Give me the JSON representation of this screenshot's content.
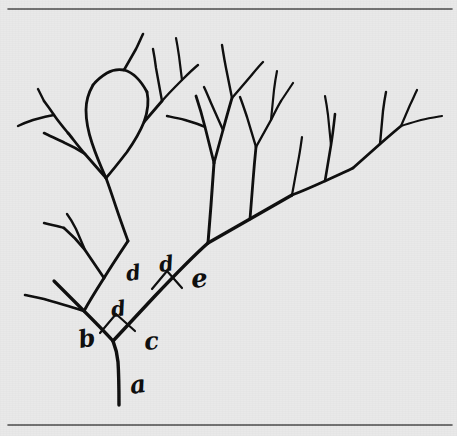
{
  "figure": {
    "background_color": "#e9e9e9",
    "ink_color": "#0d0d0d",
    "rule_color": "#4a4a4a",
    "width": 457,
    "height": 436
  },
  "rules": [
    {
      "name": "top-rule",
      "y": 9,
      "x1": 8,
      "x2": 452
    },
    {
      "name": "bottom-rule",
      "y": 425,
      "x1": 8,
      "x2": 452
    }
  ],
  "labels": [
    {
      "id": "a",
      "text": "a",
      "x": 131,
      "y": 394,
      "size": 25,
      "rotate": -8,
      "meaning": "trunk-segment"
    },
    {
      "id": "b",
      "text": "b",
      "x": 80,
      "y": 348,
      "size": 24,
      "rotate": -10,
      "meaning": "left-branch-segment"
    },
    {
      "id": "c",
      "text": "c",
      "x": 145,
      "y": 350,
      "size": 24,
      "rotate": -6,
      "meaning": "right-branch-segment"
    },
    {
      "id": "d1",
      "text": "d",
      "x": 112,
      "y": 317,
      "size": 21,
      "rotate": -8,
      "meaning": "lower-fork-angle"
    },
    {
      "id": "d2",
      "text": "d",
      "x": 127,
      "y": 281,
      "size": 21,
      "rotate": -8,
      "meaning": "upper-left-angle"
    },
    {
      "id": "d3",
      "text": "d",
      "x": 160,
      "y": 272,
      "size": 21,
      "rotate": -8,
      "meaning": "upper-fork-angle"
    },
    {
      "id": "e",
      "text": "e",
      "x": 192,
      "y": 288,
      "size": 26,
      "rotate": -6,
      "meaning": "upper-right-branch-segment"
    }
  ],
  "angle_arcs": [
    {
      "name": "lower-fork-arc",
      "d": "M 100 333 L 116 314 L 135 331"
    },
    {
      "name": "upper-fork-arc",
      "d": "M 152 289 L 167 271 L 182 288"
    }
  ],
  "branches": [
    {
      "name": "trunk",
      "w": 3.4,
      "d": "M 119 405 C 119 392, 119 377, 118 362 C 117 352, 115 346, 113 341"
    },
    {
      "name": "left-main",
      "w": 3.2,
      "d": "M 113 341 C 104 331, 94 321, 84 311 C 72 299, 63 290, 54 281"
    },
    {
      "name": "right-main",
      "w": 3.4,
      "d": "M 113 341 C 126 327, 140 312, 154 297 C 172 278, 190 259, 208 243"
    },
    {
      "name": "left-main-upper",
      "w": 3.0,
      "d": "M 84 311 C 90 300, 97 289, 104 278 C 112 265, 120 253, 128 241"
    },
    {
      "name": "left-lower-twig",
      "w": 2.6,
      "d": "M 84 311 C 72 307, 58 303, 44 299 C 36 297, 30 296, 25 295"
    },
    {
      "name": "left-fork-node",
      "w": 2.8,
      "d": "M 104 278 C 98 269, 91 259, 85 250 C 78 241, 71 234, 64 228"
    },
    {
      "name": "left-fork-b1",
      "w": 2.4,
      "d": "M 85 250 C 82 243, 79 236, 76 229 C 73 223, 70 218, 67 214"
    },
    {
      "name": "left-fork-b2",
      "w": 2.4,
      "d": "M 64 228 C 58 226, 51 225, 44 223"
    },
    {
      "name": "left-top-stem",
      "w": 2.8,
      "d": "M 128 241 C 124 230, 120 219, 116 207 C 112 195, 109 186, 106 178"
    },
    {
      "name": "left-canopy-node",
      "w": 2.8,
      "d": "M 106 178 C 99 170, 92 162, 85 154 C 78 146, 73 139, 68 133"
    },
    {
      "name": "left-canopy-left",
      "w": 2.6,
      "d": "M 85 154 C 79 150, 72 146, 65 143 C 57 139, 50 136, 44 133"
    },
    {
      "name": "left-canopy-up",
      "w": 2.6,
      "d": "M 68 133 C 63 127, 58 121, 54 115 C 50 109, 47 105, 44 101"
    },
    {
      "name": "left-canopy-tip1",
      "w": 2.4,
      "d": "M 54 115 C 47 116, 40 118, 33 120 C 27 122, 22 124, 18 126"
    },
    {
      "name": "left-canopy-tip2",
      "w": 2.4,
      "d": "M 44 101 C 42 97, 40 93, 38 89"
    },
    {
      "name": "leaf-left-arc",
      "w": 2.8,
      "d": "M 106 178 C 101 167, 96 155, 92 143 C 88 131, 86 120, 86 110 C 86 100, 89 92, 93 85"
    },
    {
      "name": "leaf-right-arc",
      "w": 2.8,
      "d": "M 106 178 C 113 170, 120 161, 127 152 C 134 142, 140 132, 144 122 C 148 111, 149 101, 147 92"
    },
    {
      "name": "leaf-apex",
      "w": 2.8,
      "d": "M 93 85 C 97 80, 102 76, 107 73 C 112 70, 118 69, 124 70 C 132 72, 140 79, 147 92"
    },
    {
      "name": "leaf-stem-up",
      "w": 2.6,
      "d": "M 124 70 C 128 63, 132 56, 136 49 C 139 43, 141 38, 143 34"
    },
    {
      "name": "mid-left-branch",
      "w": 2.8,
      "d": "M 144 122 C 150 115, 156 108, 162 101"
    },
    {
      "name": "mid-left-tip",
      "w": 2.4,
      "d": "M 162 101 C 160 90, 158 79, 156 68 C 155 60, 154 54, 153 49"
    },
    {
      "name": "mid-left-tip2",
      "w": 2.4,
      "d": "M 162 101 C 168 94, 175 87, 182 80 C 188 74, 193 69, 198 65"
    },
    {
      "name": "mid-tip-end",
      "w": 2.2,
      "d": "M 182 80 C 181 72, 180 64, 179 56 C 178 49, 177 43, 176 38"
    },
    {
      "name": "center-stem",
      "w": 3.0,
      "d": "M 208 243 C 209 231, 210 218, 211 205 C 212 190, 213 176, 214 163"
    },
    {
      "name": "center-node-left",
      "w": 2.8,
      "d": "M 214 163 C 211 151, 208 139, 205 127 C 202 115, 199 105, 196 96"
    },
    {
      "name": "center-left-tip",
      "w": 2.4,
      "d": "M 205 127 C 199 124, 192 122, 185 120 C 178 118, 172 117, 167 116"
    },
    {
      "name": "center-up-stem",
      "w": 2.8,
      "d": "M 214 163 C 217 152, 220 141, 223 130 C 226 119, 229 108, 232 98"
    },
    {
      "name": "center-up-fork-l",
      "w": 2.4,
      "d": "M 223 130 C 219 121, 215 112, 211 103 C 208 96, 206 91, 204 87"
    },
    {
      "name": "center-up-fork-r",
      "w": 2.4,
      "d": "M 232 98 C 230 88, 228 78, 226 68 C 224 58, 223 51, 222 45"
    },
    {
      "name": "center-up-tip",
      "w": 2.4,
      "d": "M 232 98 C 238 91, 244 84, 250 77 C 255 71, 259 66, 263 62"
    },
    {
      "name": "right-main-2",
      "w": 3.2,
      "d": "M 208 243 C 222 235, 236 227, 250 219 C 264 211, 278 203, 292 195"
    },
    {
      "name": "right-stem-up",
      "w": 2.8,
      "d": "M 250 219 C 251 207, 252 194, 253 181 C 254 168, 255 157, 256 147"
    },
    {
      "name": "right-up-fork-l",
      "w": 2.4,
      "d": "M 256 147 C 253 137, 250 127, 247 117 C 244 108, 242 102, 240 97"
    },
    {
      "name": "right-up-fork-r",
      "w": 2.4,
      "d": "M 256 147 C 261 138, 266 129, 271 120 C 275 112, 278 106, 281 101"
    },
    {
      "name": "right-up-tip-a",
      "w": 2.2,
      "d": "M 271 120 C 272 110, 273 100, 274 90 C 275 82, 276 76, 277 71"
    },
    {
      "name": "right-up-tip-b",
      "w": 2.2,
      "d": "M 281 101 C 285 95, 289 89, 293 83"
    },
    {
      "name": "right-branch-3",
      "w": 2.8,
      "d": "M 292 195 C 303 191, 314 186, 325 181 C 336 176, 345 172, 353 168"
    },
    {
      "name": "right-b3-up",
      "w": 2.6,
      "d": "M 325 181 C 327 169, 329 157, 331 145 C 333 133, 334 123, 335 114"
    },
    {
      "name": "right-b3-tip",
      "w": 2.2,
      "d": "M 331 145 C 330 135, 329 125, 328 115 C 327 107, 326 101, 325 96"
    },
    {
      "name": "right-far-node",
      "w": 2.8,
      "d": "M 353 168 C 362 160, 371 152, 380 144 C 388 137, 395 131, 401 126"
    },
    {
      "name": "right-far-up",
      "w": 2.4,
      "d": "M 380 144 C 381 133, 382 122, 383 111 C 384 103, 385 97, 386 92"
    },
    {
      "name": "right-far-tip1",
      "w": 2.2,
      "d": "M 401 126 C 407 124, 414 122, 421 120 C 429 118, 436 117, 442 116"
    },
    {
      "name": "right-far-tip2",
      "w": 2.2,
      "d": "M 401 126 C 404 119, 407 112, 410 105 C 413 99, 415 94, 417 90"
    },
    {
      "name": "right-mid-tip",
      "w": 2.2,
      "d": "M 292 195 C 294 184, 296 173, 298 162 C 300 152, 301 144, 302 137"
    }
  ]
}
